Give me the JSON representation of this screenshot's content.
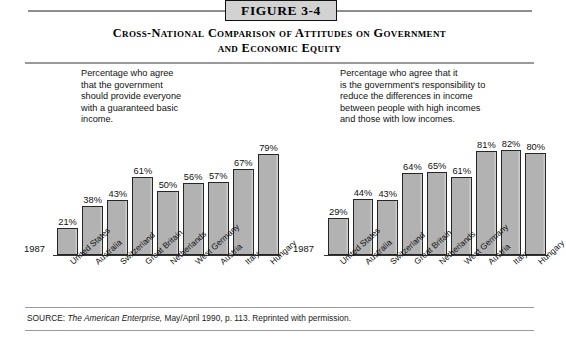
{
  "figure": {
    "badge": "FIGURE 3-4",
    "title_line1": "Cross-National Comparison of Attitudes on Government",
    "title_line2": "and Economic Equity",
    "source_label": "SOURCE:",
    "source_italic": "The American Enterprise,",
    "source_rest": "May/April 1990, p. 113. Reprinted with permission.",
    "colors": {
      "bar_fill": "#b2b2b2",
      "bar_border": "#262626",
      "rule": "#9a9a9a",
      "badge_fill": "#d2d2d2",
      "text": "#111111"
    }
  },
  "chart_data": [
    {
      "type": "bar",
      "title": "Percentage who agree\nthat the government\nshould provide everyone\nwith a guaranteed basic\nincome.",
      "xlabel": "",
      "ylabel": "",
      "year": "1987",
      "ylim": [
        0,
        100
      ],
      "grid": false,
      "categories": [
        "United States",
        "Australia",
        "Switzerland",
        "Great Britain",
        "Netherlands",
        "West Germany",
        "Austria",
        "Italy",
        "Hungary"
      ],
      "values": [
        21,
        38,
        43,
        61,
        50,
        56,
        57,
        67,
        79
      ],
      "value_labels": [
        "21%",
        "38%",
        "43%",
        "61%",
        "50%",
        "56%",
        "57%",
        "67%",
        "79%"
      ]
    },
    {
      "type": "bar",
      "title": "Percentage who agree that it\nis the government's responsibility to\nreduce the differences in income\nbetween people with high incomes\nand those with low incomes.",
      "xlabel": "",
      "ylabel": "",
      "year": "1987",
      "ylim": [
        0,
        100
      ],
      "grid": false,
      "categories": [
        "United States",
        "Australia",
        "Switzerland",
        "Great Britain",
        "Netherlands",
        "West Germany",
        "Austria",
        "Italy",
        "Hungary"
      ],
      "values": [
        29,
        44,
        43,
        64,
        65,
        61,
        81,
        82,
        80
      ],
      "value_labels": [
        "29%",
        "44%",
        "43%",
        "64%",
        "65%",
        "61%",
        "81%",
        "82%",
        "80%"
      ]
    }
  ]
}
